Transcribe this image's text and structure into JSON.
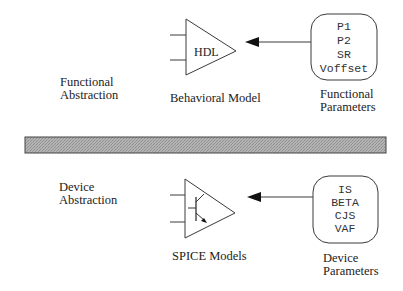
{
  "diagram": {
    "colors": {
      "stroke": "#3a3a3a",
      "separator_fill": "#a8a8a8",
      "separator_border": "#444444",
      "text": "#222222"
    },
    "functional_level": {
      "abstraction_label": [
        "Functional",
        "Abstraction"
      ],
      "model": {
        "symbol_text": "HDL",
        "caption": "Behavioral Model",
        "icon": "amplifier-triangle-icon"
      },
      "parameters": {
        "values": [
          "P1",
          "P2",
          "SR",
          "Voffset"
        ],
        "caption": [
          "Functional",
          "Parameters"
        ]
      },
      "arrow": {
        "from": "Functional Parameters",
        "to": "Behavioral Model"
      }
    },
    "separator": {
      "style": "hatched-gray-bar"
    },
    "device_level": {
      "abstraction_label": [
        "Device",
        "Abstraction"
      ],
      "model": {
        "symbol": "bipolar-transistor-in-amplifier",
        "caption": "SPICE Models",
        "icon": "amplifier-triangle-transistor-icon"
      },
      "parameters": {
        "values": [
          "IS",
          "BETA",
          "CJS",
          "VAF"
        ],
        "caption": [
          "Device",
          "Parameters"
        ]
      },
      "arrow": {
        "from": "Device Parameters",
        "to": "SPICE Models"
      }
    }
  }
}
